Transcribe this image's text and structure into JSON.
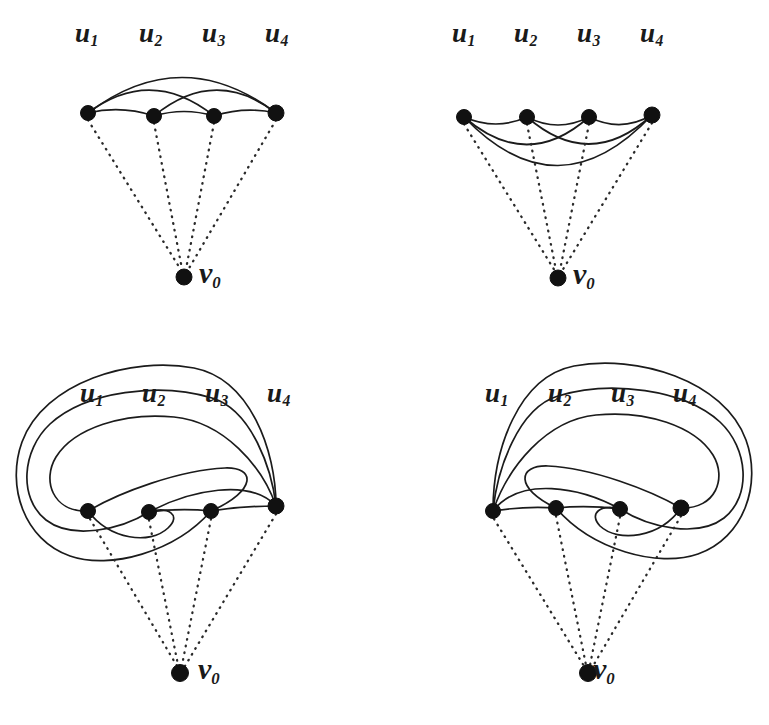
{
  "figure": {
    "background_color": "#ffffff",
    "ink_color": "#1b1b1b",
    "node_color": "#111111",
    "panel_count": 4,
    "vertex_labels": [
      "u",
      "1",
      "2",
      "3",
      "4"
    ],
    "apex_label_base": "v",
    "apex_label_sub": "0"
  },
  "labels": {
    "u_base": "u",
    "u1_sub": "1",
    "u2_sub": "2",
    "u3_sub": "3",
    "u4_sub": "4",
    "v_base": "v",
    "v0_sub": "0"
  },
  "panels": [
    {
      "id": "panel-top-left",
      "name": "graph-top-left",
      "origin": [
        0,
        0
      ],
      "u_label_y": 38,
      "u_label_x": [
        88,
        152,
        215,
        278
      ],
      "vertices": [
        {
          "name": "u1",
          "x": 88,
          "y": 113,
          "r": 7.5
        },
        {
          "name": "u2",
          "x": 154,
          "y": 116,
          "r": 7.5
        },
        {
          "name": "u3",
          "x": 214,
          "y": 116,
          "r": 7.5
        },
        {
          "name": "u4",
          "x": 276,
          "y": 113,
          "r": 8.0
        }
      ],
      "apex": {
        "name": "v0",
        "x": 184,
        "y": 277,
        "r": 8.0
      },
      "apex_label_pos": [
        198,
        262
      ],
      "solid_edges": [
        {
          "from": "u1",
          "to": "u2",
          "bow": 9
        },
        {
          "from": "u2",
          "to": "u3",
          "bow": 9
        },
        {
          "from": "u3",
          "to": "u4",
          "bow": 9
        },
        {
          "from": "u1",
          "to": "u3",
          "bow": 27
        },
        {
          "from": "u2",
          "to": "u4",
          "bow": 27
        },
        {
          "from": "u1",
          "to": "u4",
          "bow": 45
        }
      ],
      "dotted_edges": [
        {
          "from": "u1",
          "to": "v0"
        },
        {
          "from": "u2",
          "to": "v0"
        },
        {
          "from": "u3",
          "to": "v0"
        },
        {
          "from": "u4",
          "to": "v0"
        }
      ]
    },
    {
      "id": "panel-top-right",
      "name": "graph-top-right",
      "origin": [
        388,
        0
      ],
      "u_label_y": 38,
      "u_label_x": [
        465,
        527,
        590,
        652
      ],
      "vertices": [
        {
          "name": "u1",
          "x": 464,
          "y": 117,
          "r": 7.5
        },
        {
          "name": "u2",
          "x": 527,
          "y": 117,
          "r": 7.5
        },
        {
          "name": "u3",
          "x": 589,
          "y": 117,
          "r": 7.5
        },
        {
          "name": "u4",
          "x": 652,
          "y": 115,
          "r": 8.0
        }
      ],
      "apex": {
        "name": "v0",
        "x": 558,
        "y": 278,
        "r": 8.0
      },
      "apex_label_pos": [
        573,
        263
      ],
      "solid_edges": [
        {
          "from": "u1",
          "to": "u2",
          "bow": -11
        },
        {
          "from": "u2",
          "to": "u3",
          "bow": -11
        },
        {
          "from": "u3",
          "to": "u4",
          "bow": -11
        },
        {
          "from": "u1",
          "to": "u3",
          "bow": -28
        },
        {
          "from": "u2",
          "to": "u4",
          "bow": -28
        },
        {
          "from": "u1",
          "to": "u4",
          "bow": -50
        }
      ],
      "dotted_edges": [
        {
          "from": "u1",
          "to": "v0"
        },
        {
          "from": "u2",
          "to": "v0"
        },
        {
          "from": "u3",
          "to": "v0"
        },
        {
          "from": "u4",
          "to": "v0"
        }
      ]
    },
    {
      "id": "panel-bottom-left",
      "name": "graph-bottom-left",
      "origin": [
        0,
        360
      ],
      "u_label_y": 398,
      "u_label_x": [
        93,
        155,
        218,
        280
      ],
      "vertices": [
        {
          "name": "u1",
          "x": 88,
          "y": 511,
          "r": 7.5
        },
        {
          "name": "u2",
          "x": 149,
          "y": 512,
          "r": 7.5
        },
        {
          "name": "u3",
          "x": 211,
          "y": 511,
          "r": 7.5
        },
        {
          "name": "u4",
          "x": 276,
          "y": 506,
          "r": 8.0
        }
      ],
      "apex": {
        "name": "v0",
        "x": 180,
        "y": 673,
        "r": 8.5
      },
      "apex_label_pos": [
        197,
        657
      ],
      "spiral_orientation": "left",
      "dotted_edges": [
        {
          "from": "u1",
          "to": "v0"
        },
        {
          "from": "u2",
          "to": "v0"
        },
        {
          "from": "u3",
          "to": "v0"
        },
        {
          "from": "u4",
          "to": "v0"
        }
      ]
    },
    {
      "id": "panel-bottom-right",
      "name": "graph-bottom-right",
      "origin": [
        388,
        360
      ],
      "u_label_y": 398,
      "u_label_x": [
        499,
        561,
        624,
        686
      ],
      "vertices": [
        {
          "name": "u1",
          "x": 493,
          "y": 511,
          "r": 7.5
        },
        {
          "name": "u2",
          "x": 556,
          "y": 508,
          "r": 7.5
        },
        {
          "name": "u3",
          "x": 620,
          "y": 509,
          "r": 7.5
        },
        {
          "name": "u4",
          "x": 681,
          "y": 508,
          "r": 8.0
        }
      ],
      "apex": {
        "name": "v0",
        "x": 588,
        "y": 673,
        "r": 8.5
      },
      "apex_label_pos": [
        604,
        657
      ],
      "spiral_orientation": "right",
      "dotted_edges": [
        {
          "from": "u1",
          "to": "v0"
        },
        {
          "from": "u2",
          "to": "v0"
        },
        {
          "from": "u3",
          "to": "v0"
        },
        {
          "from": "u4",
          "to": "v0"
        }
      ]
    }
  ]
}
